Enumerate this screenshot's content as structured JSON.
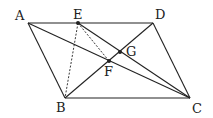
{
  "diagram": {
    "points": {
      "A": {
        "label": "A",
        "x": 28,
        "y": 23,
        "lx": 15,
        "ly": 20
      },
      "E": {
        "label": "E",
        "x": 78,
        "y": 23,
        "lx": 73,
        "ly": 19
      },
      "D": {
        "label": "D",
        "x": 153,
        "y": 23,
        "lx": 155,
        "ly": 19
      },
      "B": {
        "label": "B",
        "x": 65,
        "y": 98,
        "lx": 56,
        "ly": 112
      },
      "C": {
        "label": "C",
        "x": 190,
        "y": 98,
        "lx": 192,
        "ly": 113
      },
      "G": {
        "label": "G",
        "x": 120,
        "y": 52,
        "lx": 126,
        "ly": 56
      },
      "F": {
        "label": "F",
        "x": 109,
        "y": 61,
        "lx": 104,
        "ly": 76
      }
    },
    "solid_segments": [
      [
        "A",
        "D"
      ],
      [
        "A",
        "B"
      ],
      [
        "B",
        "C"
      ],
      [
        "D",
        "C"
      ],
      [
        "A",
        "C"
      ],
      [
        "B",
        "D"
      ],
      [
        "E",
        "C"
      ]
    ],
    "dashed_segments": [
      [
        "E",
        "B"
      ],
      [
        "E",
        "F"
      ]
    ],
    "dot_points": [
      "E",
      "G",
      "F"
    ],
    "line_color": "#222222"
  }
}
